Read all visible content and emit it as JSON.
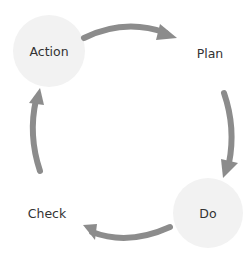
{
  "diagram": {
    "type": "cycle",
    "colors": {
      "circle_fill": "#f2f2f2",
      "arrow": "#8c8c8c",
      "text": "#333333",
      "background": "#ffffff"
    },
    "nodes": [
      {
        "id": "action",
        "label": "Action",
        "highlighted": true
      },
      {
        "id": "plan",
        "label": "Plan",
        "highlighted": false
      },
      {
        "id": "do",
        "label": "Do",
        "highlighted": true
      },
      {
        "id": "check",
        "label": "Check",
        "highlighted": false
      }
    ],
    "edges": [
      {
        "from": "action",
        "to": "plan"
      },
      {
        "from": "plan",
        "to": "do"
      },
      {
        "from": "do",
        "to": "check"
      },
      {
        "from": "check",
        "to": "action"
      }
    ]
  }
}
